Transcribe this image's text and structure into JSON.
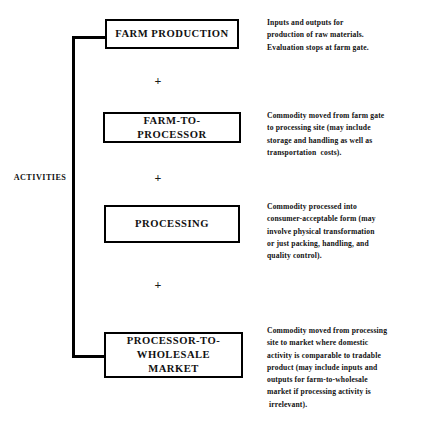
{
  "diagram": {
    "group_label": "ACTIVITIES",
    "connector_symbol": "+",
    "stages": [
      {
        "id": "farm-production",
        "title_line1": "FARM PRODUCTION",
        "title_line2": "",
        "description_lines": [
          "Inputs and outputs for",
          "production of raw materials.",
          "Evaluation stops at farm gate."
        ]
      },
      {
        "id": "farm-to-processor",
        "title_line1": "FARM-TO-PROCESSOR",
        "title_line2": "",
        "description_lines": [
          "Commodity moved from farm gate",
          "to processing site (may include",
          "storage and handling as well as",
          "transportation  costs)."
        ]
      },
      {
        "id": "processing",
        "title_line1": "PROCESSING",
        "title_line2": "",
        "description_lines": [
          "Commodity processed into",
          "consumer-acceptable form (may",
          "involve physical transformation",
          "or just packing, handling, and",
          "quality control)."
        ]
      },
      {
        "id": "processor-to-wholesale-market",
        "title_line1": "PROCESSOR-TO-",
        "title_line2": "WHOLESALE MARKET",
        "description_lines": [
          "Commodity moved from processing",
          "site to market where domestic",
          "activity is comparable to tradable",
          "product (may include inputs and",
          "outputs for farm-to-wholesale",
          "market if processing activity is",
          " irrelevant)."
        ]
      }
    ],
    "colors": {
      "background": "#ffffff",
      "ink": "#111111",
      "rule": "#000000"
    }
  }
}
